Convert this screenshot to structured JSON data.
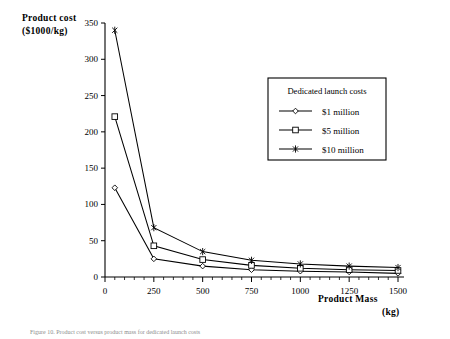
{
  "figure": {
    "caption": "Figure 10. Product cost versus product mass for dedicated launch costs"
  },
  "chart_data": {
    "type": "line",
    "title": "",
    "xlabel": "Product  Mass",
    "xlabel_units": "(kg)",
    "ylabel": "Product  cost",
    "ylabel_units": "($1000/kg)",
    "xlim": [
      0,
      1500
    ],
    "ylim": [
      0,
      350
    ],
    "xticks": [
      0,
      250,
      500,
      750,
      1000,
      1250,
      1500
    ],
    "yticks": [
      0,
      50,
      100,
      150,
      200,
      250,
      300,
      350
    ],
    "xticklabels": [
      "0",
      "250",
      "500",
      "750",
      "1000",
      "1250",
      "1500"
    ],
    "yticklabels": [
      "0",
      "50",
      "100",
      "150",
      "200",
      "250",
      "300",
      "350"
    ],
    "grid": false,
    "legend_position": "upper-right-inset",
    "legend_title": "Dedicated launch costs",
    "x": [
      50,
      250,
      500,
      750,
      1000,
      1250,
      1500
    ],
    "series": [
      {
        "name": "$1 million",
        "marker": "diamond",
        "values": [
          123,
          25,
          15,
          10,
          8,
          7,
          5
        ]
      },
      {
        "name": "$5 million",
        "marker": "square",
        "values": [
          221,
          43,
          24,
          16,
          12,
          10,
          9
        ]
      },
      {
        "name": "$10 million",
        "marker": "cross",
        "values": [
          340,
          68,
          35,
          23,
          18,
          15,
          13
        ]
      }
    ]
  },
  "colors": {
    "foreground": "#000000",
    "background": "#ffffff"
  }
}
